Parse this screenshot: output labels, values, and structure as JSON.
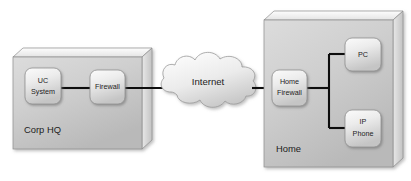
{
  "diagram": {
    "background_color": "#ffffff",
    "line_color": "#0d0d0d",
    "panel_fill": "#c9c9c9",
    "node_fill": "#e2e2e2",
    "text_color": "#1c1c1c"
  },
  "zones": {
    "corp": {
      "label": "Corp HQ",
      "nodes": {
        "uc_system": {
          "label_line1": "UC",
          "label_line2": "System"
        },
        "firewall": {
          "label": "Firewall"
        }
      }
    },
    "home": {
      "label": "Home",
      "nodes": {
        "home_firewall": {
          "label_line1": "Home",
          "label_line2": "Firewall"
        },
        "pc": {
          "label": "PC"
        },
        "ip_phone": {
          "label_line1": "IP",
          "label_line2": "Phone"
        }
      }
    }
  },
  "cloud": {
    "label": "Internet"
  }
}
